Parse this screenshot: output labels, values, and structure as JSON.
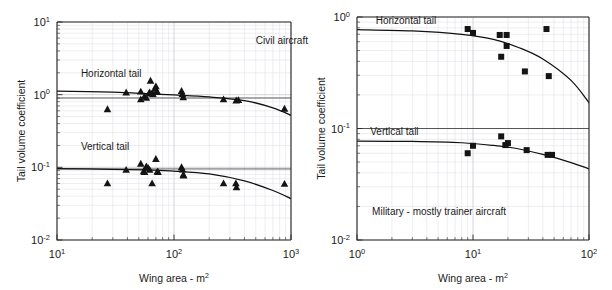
{
  "figure": {
    "width": 612,
    "height": 290,
    "background": "#ffffff",
    "ink_color": "#141414",
    "grid_color": "#b9b9c4",
    "minor_grid_color": "#d9d9e2"
  },
  "chart_data": [
    {
      "id": "civil",
      "type": "scatter",
      "title": "Civil aircraft",
      "xlabel": "Wing area - m2",
      "xlabel_base": "Wing area - m",
      "xlabel_exp": "2",
      "ylabel": "Tail volume coefficient",
      "xscale": "log",
      "yscale": "log",
      "xlim": [
        10,
        1000
      ],
      "ylim": [
        0.01,
        10
      ],
      "xticks": [
        10,
        100,
        1000
      ],
      "xticklabels": [
        "10 1",
        "10 2",
        "10 3"
      ],
      "xtick_mant": [
        "10",
        "10",
        "10"
      ],
      "xtick_exp": [
        "1",
        "2",
        "3"
      ],
      "yticks": [
        0.01,
        0.1,
        1,
        10
      ],
      "ytick_mant": [
        "10",
        "10",
        "10",
        "10"
      ],
      "ytick_exp": [
        "-2",
        "-1",
        "0",
        "1"
      ],
      "grid": true,
      "legend_position": "inline-annotations",
      "annotations": [
        {
          "text": "Civil aircraft",
          "x": 500,
          "y": 5.0,
          "name": "civil-aircraft-annotation"
        },
        {
          "text": "Horizontal tail",
          "x": 16,
          "y": 1.75,
          "name": "horizontal-tail-label"
        },
        {
          "text": "Vertical tail",
          "x": 16,
          "y": 0.175,
          "name": "vertical-tail-label"
        }
      ],
      "reference_lines": [
        {
          "y": 0.9,
          "name": "horizontal-tail-reference-line"
        },
        {
          "y": 0.095,
          "name": "vertical-tail-reference-line"
        }
      ],
      "series": [
        {
          "name": "Horizontal tail",
          "marker": "triangle",
          "points": [
            [
              27,
              0.63
            ],
            [
              39,
              1.07
            ],
            [
              52,
              1.1
            ],
            [
              52,
              0.86
            ],
            [
              56,
              0.95
            ],
            [
              58,
              0.9
            ],
            [
              61,
              1.03
            ],
            [
              62,
              1.07
            ],
            [
              63,
              1.55
            ],
            [
              65,
              1.05
            ],
            [
              66,
              1.02
            ],
            [
              69,
              1.22
            ],
            [
              70,
              1.3
            ],
            [
              71,
              1.12
            ],
            [
              72,
              1.08
            ],
            [
              116,
              1.12
            ],
            [
              118,
              1.02
            ],
            [
              120,
              0.92
            ],
            [
              265,
              0.86
            ],
            [
              340,
              0.83
            ],
            [
              355,
              0.84
            ],
            [
              880,
              0.64
            ]
          ],
          "trend": [
            [
              10,
              1.12
            ],
            [
              30,
              1.08
            ],
            [
              60,
              1.03
            ],
            [
              100,
              0.99
            ],
            [
              200,
              0.93
            ],
            [
              400,
              0.83
            ],
            [
              700,
              0.66
            ],
            [
              1000,
              0.52
            ]
          ]
        },
        {
          "name": "Vertical tail",
          "marker": "triangle",
          "points": [
            [
              27,
              0.06
            ],
            [
              39,
              0.092
            ],
            [
              52,
              0.112
            ],
            [
              55,
              0.088
            ],
            [
              56,
              0.086
            ],
            [
              58,
              0.103
            ],
            [
              60,
              0.098
            ],
            [
              62,
              0.092
            ],
            [
              65,
              0.06
            ],
            [
              70,
              0.13
            ],
            [
              72,
              0.087
            ],
            [
              73,
              0.086
            ],
            [
              116,
              0.1
            ],
            [
              118,
              0.093
            ],
            [
              120,
              0.079
            ],
            [
              121,
              0.077
            ],
            [
              265,
              0.06
            ],
            [
              338,
              0.06
            ],
            [
              342,
              0.053
            ],
            [
              880,
              0.059
            ]
          ],
          "trend": [
            [
              10,
              0.096
            ],
            [
              30,
              0.094
            ],
            [
              60,
              0.092
            ],
            [
              100,
              0.089
            ],
            [
              200,
              0.081
            ],
            [
              400,
              0.065
            ],
            [
              700,
              0.048
            ],
            [
              1000,
              0.037
            ]
          ]
        }
      ]
    },
    {
      "id": "military",
      "type": "scatter",
      "title": "Military - mostly trainer aircraft",
      "xlabel": "Wing area - m2",
      "xlabel_base": "Wing area - m",
      "xlabel_exp": "2",
      "ylabel": "Tail volume coefficient",
      "xscale": "log",
      "yscale": "log",
      "xlim": [
        1,
        100
      ],
      "ylim": [
        0.01,
        1
      ],
      "xticks": [
        1,
        10,
        100
      ],
      "xtick_mant": [
        "10",
        "10",
        "10"
      ],
      "xtick_exp": [
        "0",
        "1",
        "2"
      ],
      "yticks": [
        0.01,
        0.1,
        1
      ],
      "ytick_mant": [
        "10",
        "10",
        "10"
      ],
      "ytick_exp": [
        "-2",
        "-1",
        "0"
      ],
      "grid": true,
      "legend_position": "inline-annotations",
      "annotations": [
        {
          "text": "Military - mostly trainer aircraft",
          "x": 1.35,
          "y": 0.0168,
          "name": "military-aircraft-annotation"
        },
        {
          "text": "Horizontal tail",
          "x": 1.45,
          "y": 0.86,
          "name": "horizontal-tail-label"
        },
        {
          "text": "Vertical tail",
          "x": 1.3,
          "y": 0.088,
          "name": "vertical-tail-label"
        }
      ],
      "reference_lines": [
        {
          "y": 0.1,
          "name": "vertical-tail-reference-line"
        }
      ],
      "series": [
        {
          "name": "Horizontal tail",
          "marker": "square",
          "points": [
            [
              9.0,
              0.78
            ],
            [
              10.0,
              0.72
            ],
            [
              17.0,
              0.69
            ],
            [
              19.5,
              0.69
            ],
            [
              19.5,
              0.55
            ],
            [
              17.5,
              0.44
            ],
            [
              28.0,
              0.325
            ],
            [
              43.0,
              0.78
            ],
            [
              45.0,
              0.295
            ]
          ],
          "trend": [
            [
              1,
              0.77
            ],
            [
              3,
              0.75
            ],
            [
              8,
              0.7
            ],
            [
              15,
              0.63
            ],
            [
              25,
              0.53
            ],
            [
              40,
              0.42
            ],
            [
              70,
              0.27
            ],
            [
              100,
              0.17
            ]
          ]
        },
        {
          "name": "Vertical tail",
          "marker": "square",
          "points": [
            [
              9.0,
              0.06
            ],
            [
              10.0,
              0.07
            ],
            [
              17.5,
              0.085
            ],
            [
              19.0,
              0.071
            ],
            [
              20.0,
              0.074
            ],
            [
              29.0,
              0.064
            ],
            [
              44.0,
              0.058
            ],
            [
              48.0,
              0.058
            ]
          ],
          "trend": [
            [
              1,
              0.077
            ],
            [
              3,
              0.0765
            ],
            [
              8,
              0.0745
            ],
            [
              15,
              0.0705
            ],
            [
              25,
              0.0655
            ],
            [
              40,
              0.0585
            ],
            [
              70,
              0.0495
            ],
            [
              100,
              0.0435
            ]
          ]
        }
      ]
    }
  ]
}
